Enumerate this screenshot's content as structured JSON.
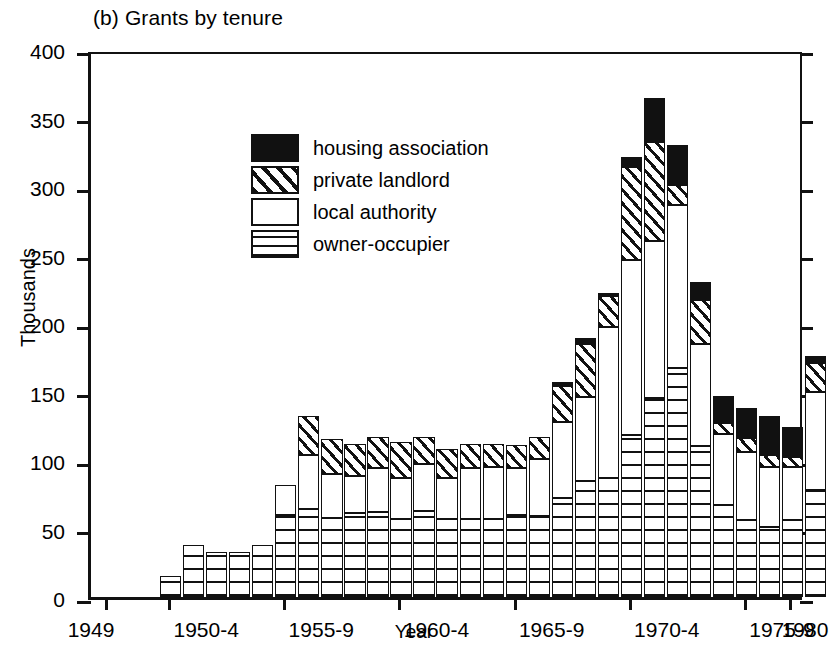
{
  "chart_data": {
    "type": "bar",
    "stacked": true,
    "title": "(b) Grants by tenure",
    "xlabel": "Year",
    "ylabel": "Thousands",
    "ylim": [
      0,
      400
    ],
    "ytick_labels": [
      "0",
      "50",
      "100",
      "150",
      "200",
      "250",
      "300",
      "350",
      "400"
    ],
    "ytick_values": [
      0,
      50,
      100,
      150,
      200,
      250,
      300,
      350,
      400
    ],
    "xtick_labels": [
      "1949",
      "1950-4",
      "1955-9",
      "1960-4",
      "1965-9",
      "1970-4",
      "1975-9",
      "1980"
    ],
    "xtick_years": [
      1949,
      1952,
      1957,
      1962,
      1967,
      1972,
      1977,
      1980
    ],
    "grid": false,
    "legend_position": "upper-left-inside",
    "x": [
      1952,
      1953,
      1954,
      1955,
      1956,
      1957,
      1958,
      1959,
      1960,
      1961,
      1962,
      1963,
      1964,
      1965,
      1966,
      1967,
      1968,
      1969,
      1970,
      1971,
      1972,
      1973,
      1974,
      1975,
      1976,
      1977,
      1978,
      1979,
      1980
    ],
    "series": [
      {
        "name": "owner-occupier",
        "fill": "grid",
        "values": [
          15,
          38,
          33,
          33,
          38,
          60,
          64,
          58,
          61,
          62,
          57,
          63,
          57,
          57,
          57,
          60,
          59,
          72,
          85,
          87,
          118,
          145,
          167,
          110,
          67,
          56,
          51,
          56,
          78
        ]
      },
      {
        "name": "local authority",
        "fill": "white",
        "values": [
          0,
          0,
          0,
          0,
          0,
          22,
          40,
          32,
          27,
          32,
          30,
          34,
          30,
          37,
          38,
          34,
          42,
          56,
          61,
          110,
          128,
          115,
          119,
          75,
          52,
          50,
          44,
          39,
          72
        ]
      },
      {
        "name": "private landlord",
        "fill": "hatch",
        "values": [
          0,
          0,
          0,
          0,
          0,
          0,
          28,
          25,
          24,
          23,
          26,
          20,
          21,
          18,
          17,
          17,
          16,
          26,
          39,
          23,
          68,
          72,
          15,
          32,
          8,
          10,
          9,
          7,
          21
        ]
      },
      {
        "name": "housing association",
        "fill": "black",
        "values": [
          0,
          0,
          0,
          0,
          0,
          0,
          0,
          0,
          0,
          0,
          0,
          0,
          0,
          0,
          0,
          0,
          0,
          3,
          4,
          2,
          7,
          32,
          29,
          13,
          20,
          22,
          28,
          22,
          5
        ]
      }
    ]
  },
  "legend": {
    "items": [
      {
        "label": "housing association",
        "fill": "ha"
      },
      {
        "label": "private landlord",
        "fill": "pl"
      },
      {
        "label": "local authority",
        "fill": "la"
      },
      {
        "label": "owner-occupier",
        "fill": "oo"
      }
    ]
  }
}
